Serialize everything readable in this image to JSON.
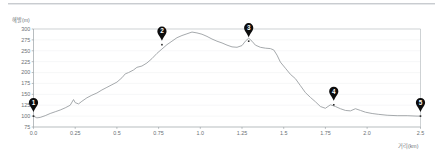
{
  "chart_data": {
    "type": "line",
    "title": "",
    "subtitle": "",
    "xlabel": "거리(km)",
    "ylabel": "해발(m)",
    "xlim": [
      0.0,
      2.32
    ],
    "ylim": [
      75,
      300
    ],
    "grid": true,
    "legend": "none",
    "x_ticks": [
      "0.0",
      "0.25",
      "0.5",
      "0.75",
      "1.0",
      "1.25",
      "1.5",
      "1.75",
      "2.0",
      "2.5"
    ],
    "x_tick_values": [
      0.0,
      0.25,
      0.5,
      0.75,
      1.0,
      1.25,
      1.5,
      1.75,
      2.0,
      2.32
    ],
    "y_ticks": [
      "300",
      "275",
      "250",
      "225",
      "200",
      "175",
      "150",
      "125",
      "100",
      "75"
    ],
    "y_tick_values": [
      300,
      275,
      250,
      225,
      200,
      175,
      150,
      125,
      100,
      75
    ],
    "series": [
      {
        "name": "elevation-profile",
        "color": "#9b9fa3",
        "x": [
          0.0,
          0.02,
          0.04,
          0.07,
          0.1,
          0.13,
          0.16,
          0.19,
          0.22,
          0.24,
          0.25,
          0.27,
          0.29,
          0.32,
          0.35,
          0.38,
          0.41,
          0.44,
          0.47,
          0.5,
          0.53,
          0.55,
          0.57,
          0.6,
          0.62,
          0.65,
          0.68,
          0.71,
          0.74,
          0.77,
          0.8,
          0.83,
          0.86,
          0.89,
          0.92,
          0.95,
          0.98,
          1.01,
          1.04,
          1.07,
          1.1,
          1.13,
          1.16,
          1.19,
          1.22,
          1.25,
          1.27,
          1.29,
          1.31,
          1.33,
          1.36,
          1.39,
          1.42,
          1.44,
          1.46,
          1.48,
          1.51,
          1.54,
          1.57,
          1.6,
          1.63,
          1.66,
          1.69,
          1.72,
          1.75,
          1.78,
          1.81,
          1.84,
          1.87,
          1.9,
          1.93,
          1.96,
          1.99,
          2.03,
          2.07,
          2.12,
          2.18,
          2.24,
          2.3,
          2.32
        ],
        "y": [
          100,
          96,
          97,
          101,
          106,
          110,
          114,
          119,
          125,
          138,
          131,
          128,
          134,
          142,
          148,
          153,
          160,
          166,
          172,
          178,
          188,
          197,
          200,
          206,
          212,
          215,
          222,
          232,
          244,
          254,
          264,
          272,
          280,
          285,
          289,
          293,
          291,
          288,
          283,
          277,
          272,
          268,
          263,
          259,
          258,
          262,
          272,
          279,
          272,
          263,
          258,
          256,
          255,
          252,
          240,
          224,
          210,
          196,
          186,
          170,
          154,
          143,
          133,
          122,
          118,
          126,
          122,
          117,
          113,
          112,
          117,
          113,
          109,
          106,
          104,
          102,
          101,
          101,
          100,
          100
        ]
      }
    ],
    "annotations": [
      {
        "id": "1",
        "label": "1",
        "x": 0.0,
        "y": 100
      },
      {
        "id": "2",
        "label": "2",
        "x": 0.77,
        "y": 264
      },
      {
        "id": "3",
        "label": "3",
        "x": 1.29,
        "y": 272
      },
      {
        "id": "4",
        "label": "4",
        "x": 1.8,
        "y": 126
      },
      {
        "id": "5",
        "label": "5",
        "x": 2.32,
        "y": 100
      }
    ]
  }
}
